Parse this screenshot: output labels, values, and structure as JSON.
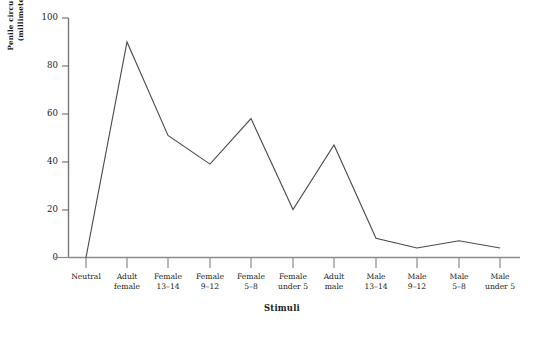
{
  "chart_data": {
    "type": "line",
    "title": "",
    "xlabel": "Stimuli",
    "ylabel": "Penile circumference response (millimeters of expansion)",
    "ylabel_lines": [
      "Penile circumference response",
      "(millimeters of expansion)"
    ],
    "categories": [
      "Neutral",
      "Adult female",
      "Female 13–14",
      "Female 9–12",
      "Female 5–8",
      "Female under 5",
      "Adult male",
      "Male 13–14",
      "Male 9–12",
      "Male 5–8",
      "Male under 5"
    ],
    "category_lines": [
      [
        "Neutral",
        ""
      ],
      [
        "Adult",
        "female"
      ],
      [
        "Female",
        "13–14"
      ],
      [
        "Female",
        "9–12"
      ],
      [
        "Female",
        "5–8"
      ],
      [
        "Female",
        "under 5"
      ],
      [
        "Adult",
        "male"
      ],
      [
        "Male",
        "13–14"
      ],
      [
        "Male",
        "9–12"
      ],
      [
        "Male",
        "5–8"
      ],
      [
        "Male",
        "under 5"
      ]
    ],
    "values": [
      0,
      90,
      51,
      39,
      58,
      20,
      47,
      8,
      4,
      7,
      4
    ],
    "ylim": [
      0,
      100
    ],
    "yticks": [
      0,
      20,
      40,
      60,
      80,
      100
    ],
    "ytick_labels": [
      "0",
      "20",
      "40",
      "60",
      "80",
      "100"
    ],
    "grid": false,
    "legend": false,
    "line_color": "#4a4a4a",
    "axis_color": "#777777"
  },
  "footer": {
    "cutoff_text": "                                                                            "
  }
}
